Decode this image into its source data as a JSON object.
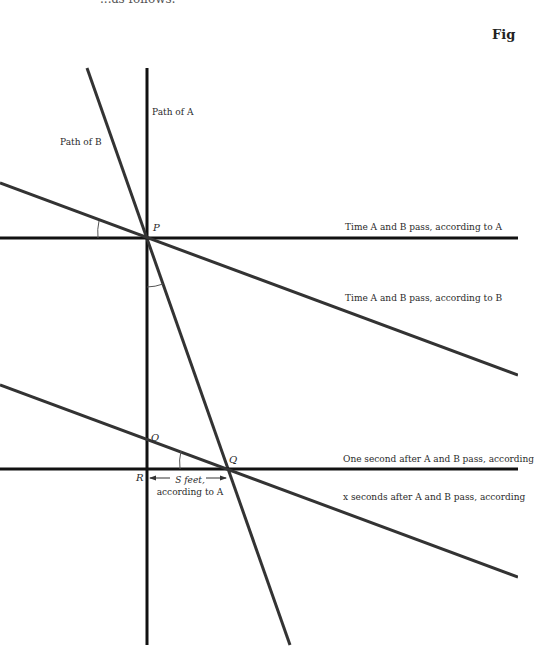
{
  "header": {
    "top_text": "...as follows:",
    "figure_label": "Fig"
  },
  "labels": {
    "path_a": "Path of A",
    "path_b": "Path of B",
    "time_pass_a": "Time A and B pass, according to A",
    "time_pass_b": "Time A and B pass, according to B",
    "one_second_after": "One second after A and B pass, according",
    "x_seconds_after": "x seconds after A and B pass,  according",
    "s_feet_line1": "S feet,",
    "s_feet_line2": "according to A"
  },
  "points": {
    "P": "P",
    "O": "O",
    "Q": "Q",
    "R": "R"
  },
  "colors": {
    "line": "#1a1a1a",
    "slanted_line": "#333333",
    "text": "#2a2a2a"
  }
}
